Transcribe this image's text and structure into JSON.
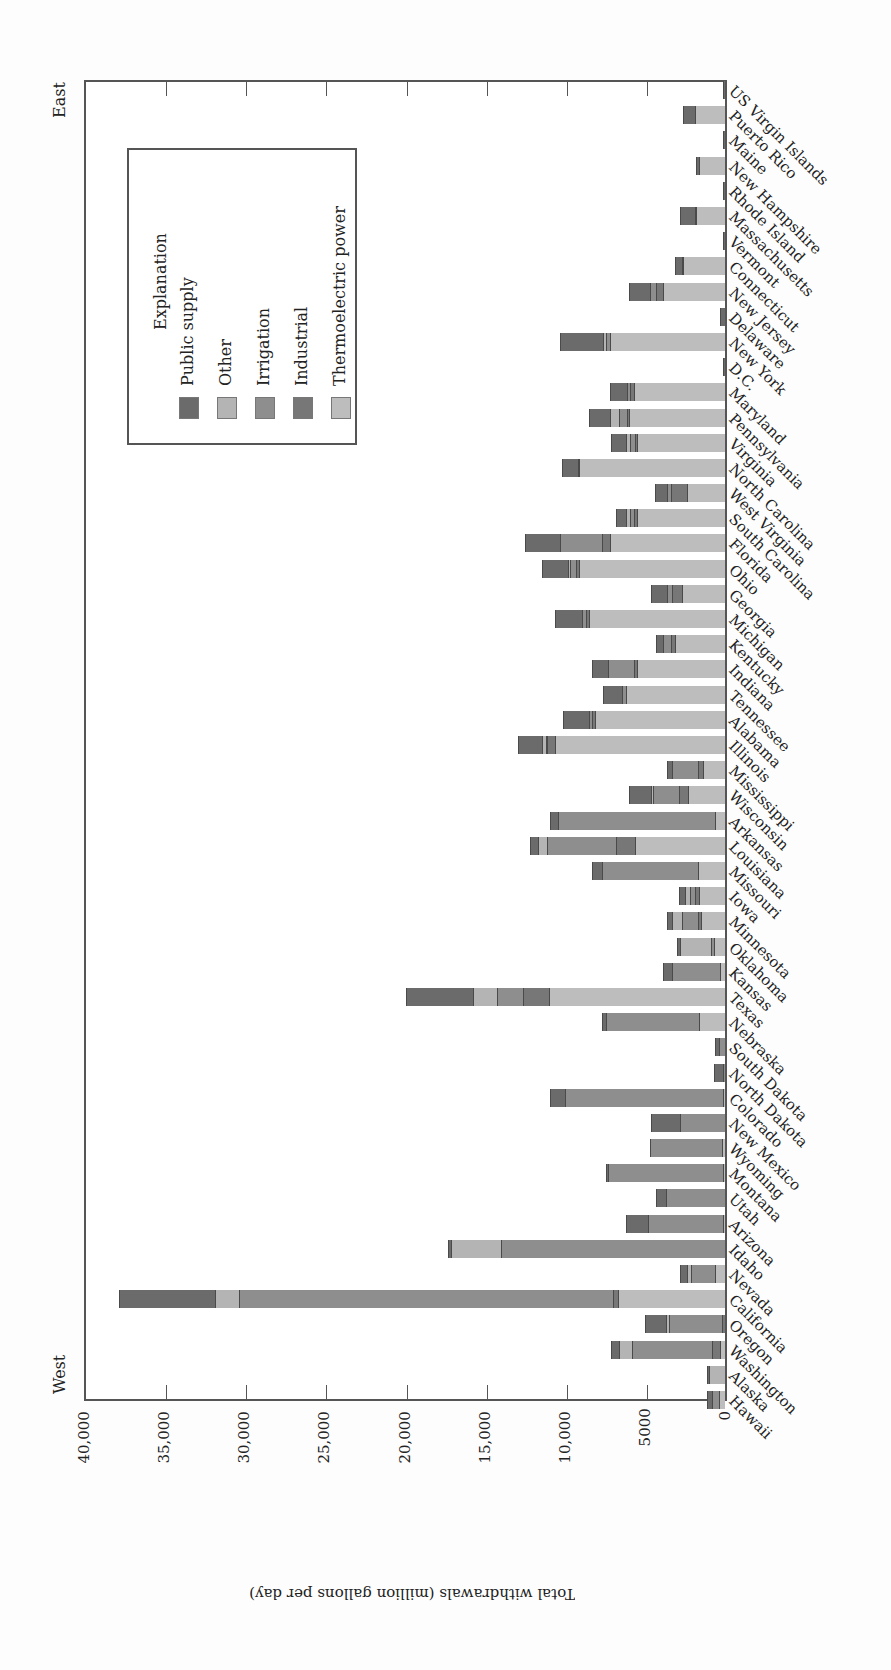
{
  "chart_data": {
    "type": "bar",
    "orientation": "horizontal-stacked (figure rotated 90°)",
    "title": "",
    "xlabel": "",
    "ylabel": "Total withdrawals (million gallons per day)",
    "ylim": [
      0,
      40000
    ],
    "ticks": [
      0,
      5000,
      10000,
      15000,
      20000,
      25000,
      30000,
      35000,
      40000
    ],
    "tick_labels": [
      "0",
      "5000",
      "10,000",
      "15,000",
      "20,000",
      "25,000",
      "30,000",
      "35,000",
      "40,000"
    ],
    "side_labels": {
      "start": "West",
      "end": "East"
    },
    "legend": {
      "title": "Explanation",
      "position": "inside, near East end",
      "entries": [
        "Public supply",
        "Other",
        "Irrigation",
        "Industrial",
        "Thermoelectric power"
      ]
    },
    "stack_order_from_baseline": [
      "Thermoelectric power",
      "Industrial",
      "Irrigation",
      "Other",
      "Public supply"
    ],
    "colors": {
      "Public supply": "#6b6b6b",
      "Other": "#b4b4b4",
      "Irrigation": "#8e8e8e",
      "Industrial": "#777777",
      "Thermoelectric power": "#bdbdbd"
    },
    "categories": [
      "Hawaii",
      "Alaska",
      "Washington",
      "Oregon",
      "California",
      "Nevada",
      "Idaho",
      "Arizona",
      "Utah",
      "Montana",
      "Wyoming",
      "New Mexico",
      "Colorado",
      "North Dakota",
      "South Dakota",
      "Nebraska",
      "Texas",
      "Kansas",
      "Oklahoma",
      "Minnesota",
      "Iowa",
      "Missouri",
      "Louisiana",
      "Arkansas",
      "Wisconsin",
      "Mississippi",
      "Illinois",
      "Alabama",
      "Tennessee",
      "Indiana",
      "Kentucky",
      "Michigan",
      "Georgia",
      "Ohio",
      "Florida",
      "South Carolina",
      "West Virginia",
      "North Carolina",
      "Virginia",
      "Pennsylvania",
      "Maryland",
      "D.C.",
      "New York",
      "Delaware",
      "New Jersey",
      "Connecticut",
      "Vermont",
      "Massachusetts",
      "Rhode Island",
      "New Hampshire",
      "Maine",
      "Puerto Rico",
      "US Virgin Islands"
    ],
    "series": [
      {
        "name": "Thermoelectric power",
        "values": [
          400,
          0,
          300,
          0,
          6700,
          600,
          0,
          100,
          0,
          100,
          200,
          0,
          100,
          0,
          0,
          1600,
          11000,
          300,
          700,
          1500,
          1600,
          1700,
          5600,
          600,
          2300,
          1400,
          10600,
          8100,
          6200,
          5500,
          3100,
          8500,
          2700,
          9100,
          7200,
          5500,
          2400,
          9100,
          5500,
          6000,
          5700,
          0,
          7200,
          0,
          3900,
          2600,
          0,
          1800,
          0,
          1600,
          0,
          1900,
          0
        ]
      },
      {
        "name": "Industrial",
        "values": [
          0,
          0,
          500,
          200,
          300,
          0,
          0,
          0,
          0,
          0,
          0,
          0,
          0,
          0,
          0,
          0,
          1600,
          0,
          0,
          200,
          300,
          0,
          1200,
          0,
          600,
          300,
          500,
          200,
          0,
          200,
          300,
          200,
          600,
          200,
          500,
          200,
          1000,
          0,
          100,
          100,
          200,
          0,
          0,
          0,
          400,
          0,
          0,
          0,
          0,
          0,
          0,
          0,
          0
        ]
      },
      {
        "name": "Irrigation",
        "values": [
          400,
          0,
          5000,
          3300,
          23300,
          1500,
          14000,
          4700,
          3700,
          7200,
          4500,
          2800,
          9900,
          100,
          400,
          5800,
          1600,
          3000,
          200,
          1000,
          300,
          6000,
          4300,
          9800,
          1600,
          1600,
          100,
          200,
          200,
          1600,
          500,
          200,
          300,
          400,
          2600,
          200,
          200,
          100,
          300,
          500,
          200,
          0,
          200,
          0,
          400,
          100,
          0,
          100,
          0,
          0,
          0,
          0,
          0
        ]
      },
      {
        "name": "Other",
        "values": [
          0,
          1000,
          800,
          200,
          1500,
          300,
          3100,
          0,
          0,
          0,
          0,
          0,
          0,
          0,
          0,
          0,
          1500,
          0,
          1900,
          600,
          300,
          0,
          600,
          0,
          100,
          0,
          200,
          0,
          0,
          0,
          0,
          0,
          0,
          100,
          0,
          300,
          0,
          0,
          300,
          600,
          0,
          0,
          200,
          0,
          0,
          0,
          0,
          0,
          0,
          0,
          0,
          0,
          0
        ]
      },
      {
        "name": "Public supply",
        "values": [
          300,
          100,
          500,
          1300,
          6000,
          400,
          200,
          1400,
          600,
          100,
          0,
          1800,
          900,
          600,
          200,
          300,
          4200,
          600,
          200,
          300,
          400,
          600,
          500,
          500,
          1400,
          300,
          1500,
          1600,
          1200,
          1000,
          400,
          1700,
          1000,
          1600,
          2200,
          600,
          800,
          1000,
          900,
          1300,
          1100,
          100,
          2700,
          300,
          1300,
          400,
          100,
          900,
          100,
          200,
          100,
          700,
          100
        ]
      }
    ],
    "totals": [
      1100,
      1100,
      7100,
      5000,
      37800,
      2800,
      17300,
      6200,
      4300,
      7400,
      4700,
      4600,
      10900,
      700,
      600,
      7700,
      19900,
      3900,
      3000,
      3600,
      2900,
      8300,
      12200,
      10900,
      6000,
      3600,
      12900,
      10100,
      7600,
      8300,
      4300,
      10600,
      4600,
      11400,
      12500,
      6800,
      4400,
      10200,
      7100,
      8500,
      7200,
      100,
      10300,
      300,
      6000,
      3100,
      100,
      2800,
      100,
      1800,
      100,
      2600,
      100
    ]
  },
  "ui": {
    "axis_title": "Total withdrawals (million gallons per day)",
    "west_label": "West",
    "east_label": "East",
    "legend_title": "Explanation",
    "legend_labels": [
      "Public supply",
      "Other",
      "Irrigation",
      "Industrial",
      "Thermoelectric power"
    ]
  }
}
